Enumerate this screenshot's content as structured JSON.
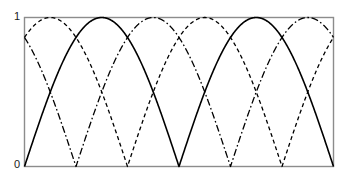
{
  "chart_data": {
    "type": "line",
    "title": "",
    "xlabel": "",
    "ylabel": "",
    "xlim": [
      0,
      2
    ],
    "ylim": [
      0,
      1
    ],
    "grid": false,
    "legend": false,
    "x_tick_labels": [],
    "y_tick_labels": [
      "0",
      "1"
    ],
    "y_ticks": [
      0,
      1
    ],
    "series": [
      {
        "name": "phi-1",
        "linestyle": "solid",
        "color": "#000000",
        "linewidth": 1.6,
        "formula": "|sin(pi*x)|",
        "phase": 0.0,
        "period": 1.0,
        "amplitude": 1.0,
        "zero_crossings_x": [
          0.0,
          1.0,
          2.0
        ],
        "peaks_x": [
          0.5,
          1.5
        ],
        "peak_value": 1
      },
      {
        "name": "phi-2",
        "linestyle": "dashed",
        "color": "#000000",
        "linewidth": 1.3,
        "formula": "|sin(pi*(x + 1/3))|",
        "phase": 0.3333,
        "period": 1.0,
        "amplitude": 1.0,
        "zero_crossings_x": [
          0.3333,
          1.3333
        ],
        "peaks_x": [
          0.8333,
          1.8333
        ],
        "peak_value": 1
      },
      {
        "name": "phi-3",
        "linestyle": "dashdot",
        "color": "#000000",
        "linewidth": 1.3,
        "formula": "|sin(pi*(x + 2/3))|",
        "phase": 0.6667,
        "period": 1.0,
        "amplitude": 1.0,
        "zero_crossings_x": [
          0.6667,
          1.6667
        ],
        "peaks_x": [
          0.1667,
          1.1667
        ],
        "peak_value": 1
      }
    ]
  },
  "axes": {
    "top_label": "1",
    "bottom_label": "0",
    "frame_color": "#8c8c8c",
    "frame_linewidth": 1.4
  },
  "colors": {
    "background": "#ffffff",
    "line": "#000000",
    "frame": "#8c8c8c",
    "text": "#1a1a1a"
  }
}
